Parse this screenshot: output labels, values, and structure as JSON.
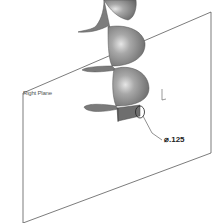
{
  "diagram": {
    "type": "cad-isometric-view",
    "plane": {
      "label": "Right Plane",
      "stroke_color": "#444444"
    },
    "part": {
      "name": "helical-flight",
      "fill_color": "#8a8a8a",
      "highlight_color": "#d8d8d8",
      "shadow_color": "#5a5a5a"
    },
    "dimension": {
      "text": "⌀.125",
      "symbol": "diameter",
      "value": ".125"
    },
    "triad": {
      "axis": "vertical-arrow"
    }
  }
}
